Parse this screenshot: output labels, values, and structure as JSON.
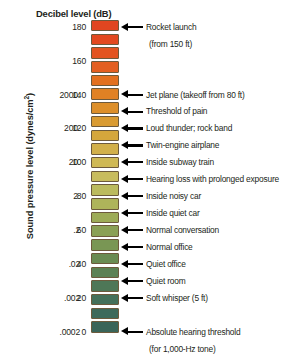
{
  "chart_data": {
    "type": "bar",
    "title": "Decibel level (dB)",
    "ylabel": "Sound pressure level (dynes/cm²)",
    "xlabel": "",
    "orientation": "vertical-scale",
    "ylim": [
      0,
      186
    ],
    "grid": false,
    "legend": null,
    "db_ticks": [
      "180",
      "160",
      "140",
      "120",
      "100",
      "80",
      "60",
      "40",
      "20",
      "0"
    ],
    "db_tick_values": [
      180,
      160,
      140,
      120,
      100,
      80,
      60,
      40,
      20,
      0
    ],
    "pressure_ticks": [
      "2000.",
      "200.",
      "20.",
      "2.",
      ".2",
      ".02",
      ".002",
      ".0002"
    ],
    "pressure_tick_values": [
      2000,
      200,
      20,
      2,
      0.2,
      0.02,
      0.002,
      0.0002
    ],
    "pressure_tick_db": [
      140,
      120,
      100,
      80,
      60,
      40,
      20,
      0
    ],
    "segments": [
      {
        "db": 180,
        "color": "#e14620"
      },
      {
        "db": 172,
        "color": "#e2491f"
      },
      {
        "db": 164,
        "color": "#e35420"
      },
      {
        "db": 156,
        "color": "#e35f21"
      },
      {
        "db": 148,
        "color": "#e2701f"
      },
      {
        "db": 140,
        "color": "#e08124"
      },
      {
        "db": 132,
        "color": "#dd8f2a"
      },
      {
        "db": 124,
        "color": "#d99b32"
      },
      {
        "db": 116,
        "color": "#d5a63c"
      },
      {
        "db": 108,
        "color": "#d2b04a"
      },
      {
        "db": 100,
        "color": "#cfb955"
      },
      {
        "db": 92,
        "color": "#c8bc5e"
      },
      {
        "db": 84,
        "color": "#bcbb5e"
      },
      {
        "db": 76,
        "color": "#aeb45a"
      },
      {
        "db": 68,
        "color": "#9dab57"
      },
      {
        "db": 60,
        "color": "#8aa055"
      },
      {
        "db": 52,
        "color": "#799654"
      },
      {
        "db": 44,
        "color": "#6a8c53"
      },
      {
        "db": 36,
        "color": "#5b8154"
      },
      {
        "db": 28,
        "color": "#4e7757"
      },
      {
        "db": 20,
        "color": "#44705a"
      },
      {
        "db": 12,
        "color": "#3d6a5b"
      },
      {
        "db": 4,
        "color": "#3a6559"
      }
    ],
    "annotations": [
      {
        "db": 180,
        "label": "Rocket launch",
        "sublabel": "(from 150 ft)"
      },
      {
        "db": 140,
        "label": "Jet plane (takeoff from 80 ft)",
        "sublabel": ""
      },
      {
        "db": 130,
        "label": "Threshold of pain",
        "sublabel": ""
      },
      {
        "db": 120,
        "label": "Loud thunder; rock band",
        "sublabel": ""
      },
      {
        "db": 110,
        "label": "Twin-engine airplane",
        "sublabel": ""
      },
      {
        "db": 100,
        "label": "Inside subway train",
        "sublabel": ""
      },
      {
        "db": 90,
        "label": "Hearing loss with prolonged exposure",
        "sublabel": ""
      },
      {
        "db": 80,
        "label": "Inside noisy car",
        "sublabel": ""
      },
      {
        "db": 70,
        "label": "Inside quiet car",
        "sublabel": ""
      },
      {
        "db": 60,
        "label": "Normal conversation",
        "sublabel": ""
      },
      {
        "db": 50,
        "label": "Normal office",
        "sublabel": ""
      },
      {
        "db": 40,
        "label": "Quiet office",
        "sublabel": ""
      },
      {
        "db": 30,
        "label": "Quiet room",
        "sublabel": ""
      },
      {
        "db": 20,
        "label": "Soft whisper (5 ft)",
        "sublabel": ""
      },
      {
        "db": 0,
        "label": "Absolute hearing threshold",
        "sublabel": "(for 1,000-Hz tone)"
      }
    ],
    "colors": {
      "top_accent": "#e14620",
      "mid_accent": "#cfb955",
      "bottom_accent": "#3a6559",
      "segment_border": "#6d5a3c",
      "text": "#231f20",
      "background": "#ffffff"
    }
  },
  "header": {
    "title": "Decibel level (dB)"
  },
  "axis": {
    "y_title_main": "Sound pressure level (dynes/cm",
    "y_title_sup": "2",
    "y_title_close": ")"
  }
}
